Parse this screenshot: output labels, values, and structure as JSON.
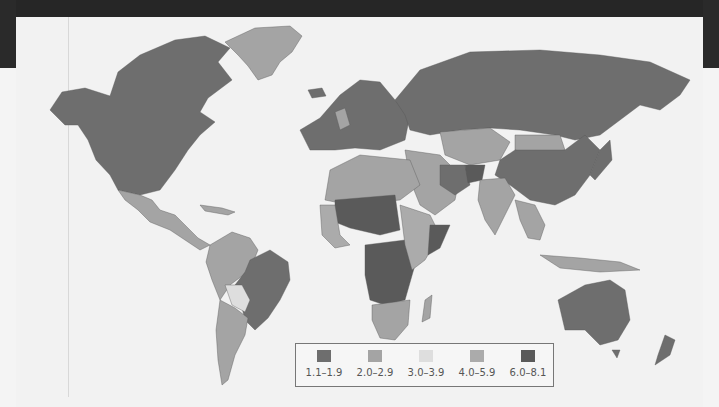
{
  "map": {
    "subject": "World fertility rate choropleth",
    "background_color": "#f2f2f2",
    "frame_color": "#262626"
  },
  "legend": {
    "items": [
      {
        "label": "1.1–1.9",
        "color": "#6e6e6e"
      },
      {
        "label": "2.0–2.9",
        "color": "#a4a4a4"
      },
      {
        "label": "3.0–3.9",
        "color": "#dedede"
      },
      {
        "label": "4.0–5.9",
        "color": "#ababab"
      },
      {
        "label": "6.0–8.1",
        "color": "#5a5a5a"
      }
    ]
  },
  "regions": [
    {
      "name": "North America",
      "class": "1.1–1.9"
    },
    {
      "name": "Greenland",
      "class": "2.0–2.9"
    },
    {
      "name": "Mexico & Central America",
      "class": "2.0–2.9"
    },
    {
      "name": "Brazil",
      "class": "1.1–1.9"
    },
    {
      "name": "Andean South America",
      "class": "2.0–2.9"
    },
    {
      "name": "Bolivia/Paraguay",
      "class": "3.0–3.9"
    },
    {
      "name": "Argentina",
      "class": "2.0–2.9"
    },
    {
      "name": "Europe",
      "class": "1.1–1.9"
    },
    {
      "name": "Russia",
      "class": "1.1–1.9"
    },
    {
      "name": "Central Asia",
      "class": "2.0–2.9"
    },
    {
      "name": "China",
      "class": "1.1–1.9"
    },
    {
      "name": "India",
      "class": "2.0–2.9"
    },
    {
      "name": "Afghanistan",
      "class": "6.0–8.1"
    },
    {
      "name": "North Africa",
      "class": "2.0–2.9"
    },
    {
      "name": "Sahel (Mali/Niger/Chad)",
      "class": "6.0–8.1"
    },
    {
      "name": "Central Africa (DRC/Angola)",
      "class": "6.0–8.1"
    },
    {
      "name": "East Africa",
      "class": "4.0–5.9"
    },
    {
      "name": "Somalia",
      "class": "6.0–8.1"
    },
    {
      "name": "Southern Africa",
      "class": "2.0–2.9"
    },
    {
      "name": "Australia",
      "class": "1.1–1.9"
    },
    {
      "name": "New Zealand",
      "class": "1.1–1.9"
    },
    {
      "name": "Southeast Asia",
      "class": "2.0–2.9"
    }
  ]
}
